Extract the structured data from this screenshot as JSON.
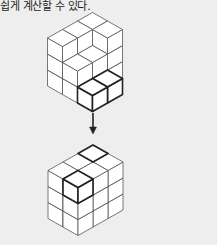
{
  "caption": "쉽게 계산할 수 있다.",
  "colors": {
    "background": "#eeeeee",
    "cube_face": "#ffffff",
    "line": "#555555",
    "bold_line": "#222222",
    "arrow": "#222222"
  },
  "figures": [
    {
      "name": "before-figure",
      "origin": [
        92.5,
        12.5
      ],
      "unit": {
        "dx": 15,
        "dy": 8.5,
        "h": 16
      },
      "columns": [
        {
          "i": 0,
          "j": 0,
          "height": 3
        },
        {
          "i": 1,
          "j": 0,
          "height": 3
        },
        {
          "i": 0,
          "j": 1,
          "height": 3
        },
        {
          "i": 0,
          "j": 2,
          "height": 3
        },
        {
          "i": 1,
          "j": 1,
          "height": 2
        },
        {
          "i": 1,
          "j": 2,
          "height": 2
        },
        {
          "i": 2,
          "j": 1,
          "height": 1,
          "bold": true
        },
        {
          "i": 2,
          "j": 2,
          "height": 1,
          "bold": true
        }
      ],
      "description": "Stacked unit cubes with two highlighted cubes to be moved"
    },
    {
      "name": "after-figure",
      "origin": [
        93,
        145
      ],
      "unit": {
        "dx": 15,
        "dy": 8.5,
        "h": 16
      },
      "size": {
        "i": 2,
        "j": 3,
        "k": 3
      },
      "bold_cubes": [
        {
          "i": 0,
          "j": 0,
          "k": 2,
          "top_only": true
        },
        {
          "i": 1,
          "j": 2,
          "k": 2
        }
      ],
      "description": "Rearranged cubes forming a 2×3×3 rectangular block"
    }
  ],
  "arrow": {
    "x": 93,
    "y1": 113,
    "y2": 134,
    "direction": "down"
  }
}
